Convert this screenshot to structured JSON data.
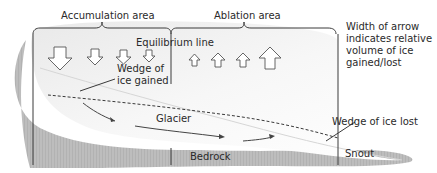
{
  "labels": {
    "accumulation_area": "Accumulation area",
    "ablation_area": "Ablation area",
    "equilibrium_line": "Equilibrium line",
    "wedge_gained_line1": "Wedge of",
    "wedge_gained_line2": "ice gained",
    "glacier": "Glacier",
    "bedrock": "Bedrock",
    "snout": "Snout",
    "wedge_lost": "Wedge of ice lost",
    "note_line1": "Width of arrow",
    "note_line2": "indicates relative",
    "note_line3": "volume of ice",
    "note_line4": "gained/lost"
  },
  "colors": {
    "bedrock": "#b5b5b5",
    "glacier": "#f2f2f2",
    "line": "#3a3a3a",
    "text": "#2a2a2a"
  },
  "arrows": {
    "accumulation_down": [
      "large",
      "medium",
      "medium",
      "small"
    ],
    "ablation_up": [
      "small",
      "medium",
      "medium",
      "large"
    ]
  }
}
